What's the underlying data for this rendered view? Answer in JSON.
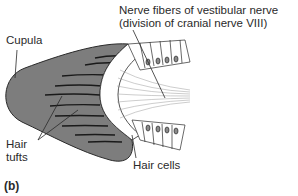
{
  "figure": {
    "panel_label": "(b)",
    "labels": {
      "nerve_line1": "Nerve fibers of vestibular nerve",
      "nerve_line2": "(division of cranial nerve VIII)",
      "cupula": "Cupula",
      "hair_tufts_line1": "Hair",
      "hair_tufts_line2": "tufts",
      "hair_cells": "Hair cells"
    },
    "colors": {
      "cupula_fill": "#7d7d7d",
      "outline": "#2a2a2a",
      "cell_fill": "#ffffff",
      "nucleus_fill": "#8a8a8a"
    }
  }
}
